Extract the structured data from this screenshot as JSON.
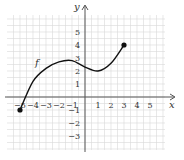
{
  "chart_data": {
    "type": "line",
    "title": "",
    "xlabel": "x",
    "ylabel": "y",
    "function_label": "f",
    "xlim": [
      -6,
      6
    ],
    "ylim": [
      -4,
      6
    ],
    "grid": true,
    "x_ticks": [
      "−5",
      "−4",
      "−3",
      "−2",
      "−1",
      "1",
      "2",
      "3",
      "4",
      "5"
    ],
    "y_ticks": [
      "5",
      "4",
      "3",
      "2",
      "1",
      "−1",
      "−2",
      "−3"
    ],
    "series": [
      {
        "name": "f",
        "x": [
          -5,
          -4,
          -3,
          -2,
          -1,
          0,
          1,
          2,
          3
        ],
        "y": [
          -1,
          1.2,
          2.2,
          2.7,
          2.8,
          2.3,
          2,
          2.6,
          4
        ]
      }
    ],
    "endpoints": [
      {
        "x": -5,
        "y": -1,
        "style": "closed"
      },
      {
        "x": 3,
        "y": 4,
        "style": "closed"
      }
    ]
  },
  "labels": {
    "x_axis": "x",
    "y_axis": "y",
    "func": "f"
  },
  "colors": {
    "grid": "#d8d8d8",
    "axis": "#555555",
    "curve": "#111111"
  }
}
